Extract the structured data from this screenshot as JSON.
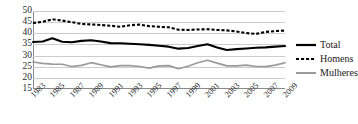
{
  "chart_data": {
    "type": "line",
    "title": "",
    "xlabel": "",
    "ylabel": "",
    "ylim": [
      15,
      50
    ],
    "ytick_values": [
      50,
      45,
      40,
      35,
      30,
      25,
      20,
      15
    ],
    "grid": true,
    "legend_position": "right",
    "x": [
      1983,
      1984,
      1985,
      1986,
      1987,
      1988,
      1989,
      1990,
      1991,
      1992,
      1993,
      1994,
      1995,
      1996,
      1997,
      1998,
      1999,
      2000,
      2001,
      2002,
      2003,
      2004,
      2005,
      2006,
      2007,
      2008,
      2009
    ],
    "xtick_labels": [
      "1983",
      "1985",
      "1987",
      "1989",
      "1991",
      "1993",
      "1995",
      "1997",
      "1999",
      "2001",
      "2003",
      "2005",
      "2007",
      "2009"
    ],
    "series": [
      {
        "name": "Total",
        "color": "#000000",
        "style": "solid",
        "values": [
          36.1,
          36.3,
          37.8,
          36.2,
          36.0,
          36.6,
          36.9,
          36.3,
          35.6,
          35.5,
          35.3,
          35.1,
          34.8,
          34.4,
          34.0,
          33.1,
          33.4,
          34.3,
          35.1,
          33.6,
          32.5,
          32.9,
          33.2,
          33.5,
          33.7,
          34.0,
          34.3
        ]
      },
      {
        "name": "Homens",
        "color": "#000000",
        "style": "dashed",
        "values": [
          44.6,
          45.2,
          46.3,
          45.7,
          45.0,
          44.2,
          44.0,
          43.7,
          43.4,
          42.9,
          43.6,
          43.9,
          43.2,
          42.9,
          42.7,
          41.6,
          41.5,
          41.7,
          41.8,
          41.5,
          41.3,
          40.8,
          40.1,
          39.7,
          40.6,
          41.0,
          41.2
        ]
      },
      {
        "name": "Mulheres",
        "color": "#9a9a9a",
        "style": "solid",
        "values": [
          27.1,
          26.5,
          26.2,
          26.1,
          25.1,
          25.6,
          26.8,
          25.9,
          24.9,
          25.5,
          25.5,
          25.1,
          24.4,
          25.4,
          25.5,
          24.1,
          25.2,
          26.8,
          27.9,
          26.6,
          25.4,
          25.4,
          25.7,
          25.1,
          25.0,
          25.7,
          26.8
        ]
      }
    ]
  },
  "legend": {
    "items": [
      {
        "label": "Total",
        "icon": "solid-line-swatch"
      },
      {
        "label": "Homens",
        "icon": "dashed-line-swatch"
      },
      {
        "label": "Mulheres",
        "icon": "gray-line-swatch"
      }
    ]
  }
}
